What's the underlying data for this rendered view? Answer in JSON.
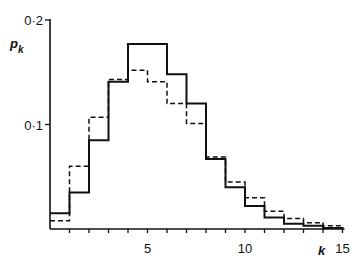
{
  "chart_data": {
    "type": "bar",
    "subtype": "step-histogram",
    "title": "",
    "xlabel": "k",
    "ylabel": "p_k",
    "categories": [
      0,
      1,
      2,
      3,
      4,
      5,
      6,
      7,
      8,
      9,
      10,
      11,
      12,
      13,
      14
    ],
    "series": [
      {
        "name": "solid",
        "style": "solid",
        "values": [
          0.015,
          0.035,
          0.085,
          0.141,
          0.177,
          0.177,
          0.148,
          0.12,
          0.067,
          0.04,
          0.022,
          0.011,
          0.005,
          0.003,
          0.001
        ]
      },
      {
        "name": "dashed",
        "style": "dashed",
        "values": [
          0.008,
          0.06,
          0.107,
          0.143,
          0.152,
          0.141,
          0.12,
          0.101,
          0.069,
          0.045,
          0.03,
          0.017,
          0.01,
          0.006,
          0.003
        ]
      }
    ],
    "xlim": [
      0,
      15
    ],
    "ylim": [
      0,
      0.2
    ],
    "xticks": [
      5,
      10,
      15
    ],
    "yticks": [
      0.1,
      0.2
    ],
    "xtick_labels": [
      "5",
      "10",
      "15"
    ],
    "ytick_labels": [
      "0·1",
      "0·2"
    ],
    "grid": false,
    "legend": null
  },
  "axes": {
    "y_label_main": "p",
    "y_label_sub": "k",
    "x_label": "k"
  }
}
